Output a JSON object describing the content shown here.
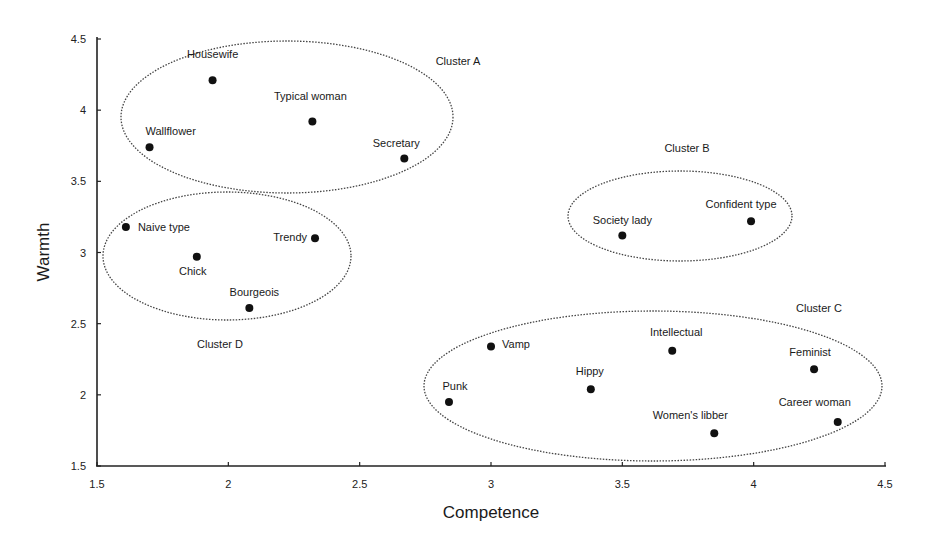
{
  "chart_data": {
    "type": "scatter",
    "title": "",
    "xlabel": "Competence",
    "ylabel": "Warmth",
    "xlim": [
      1.5,
      4.5
    ],
    "ylim": [
      1.5,
      4.5
    ],
    "x_ticks": [
      "1.5",
      "2",
      "2.5",
      "3",
      "3.5",
      "4",
      "4.5"
    ],
    "y_ticks": [
      "1.5",
      "2",
      "2.5",
      "3",
      "3.5",
      "4",
      "4.5"
    ],
    "grid": false,
    "legend": null,
    "points": [
      {
        "label": "Housewife",
        "x": 1.94,
        "y": 4.21,
        "cluster": "A"
      },
      {
        "label": "Typical woman",
        "x": 2.32,
        "y": 3.92,
        "cluster": "A"
      },
      {
        "label": "Wallflower",
        "x": 1.7,
        "y": 3.74,
        "cluster": "A"
      },
      {
        "label": "Secretary",
        "x": 2.67,
        "y": 3.66,
        "cluster": "A"
      },
      {
        "label": "Naive type",
        "x": 1.61,
        "y": 3.18,
        "cluster": "D"
      },
      {
        "label": "Trendy",
        "x": 2.33,
        "y": 3.1,
        "cluster": "D"
      },
      {
        "label": "Chick",
        "x": 1.88,
        "y": 2.97,
        "cluster": "D"
      },
      {
        "label": "Bourgeois",
        "x": 2.08,
        "y": 2.61,
        "cluster": "D"
      },
      {
        "label": "Society lady",
        "x": 3.5,
        "y": 3.12,
        "cluster": "B"
      },
      {
        "label": "Confident type",
        "x": 3.99,
        "y": 3.22,
        "cluster": "B"
      },
      {
        "label": "Vamp",
        "x": 3.0,
        "y": 2.34,
        "cluster": "C"
      },
      {
        "label": "Intellectual",
        "x": 3.69,
        "y": 2.31,
        "cluster": "C"
      },
      {
        "label": "Feminist",
        "x": 4.23,
        "y": 2.18,
        "cluster": "C"
      },
      {
        "label": "Hippy",
        "x": 3.38,
        "y": 2.04,
        "cluster": "C"
      },
      {
        "label": "Punk",
        "x": 2.84,
        "y": 1.95,
        "cluster": "C"
      },
      {
        "label": "Women's libber",
        "x": 3.85,
        "y": 1.73,
        "cluster": "C"
      },
      {
        "label": "Career woman",
        "x": 4.32,
        "y": 1.81,
        "cluster": "C"
      }
    ],
    "clusters": [
      {
        "name": "Cluster A",
        "members": [
          "Housewife",
          "Typical woman",
          "Wallflower",
          "Secretary"
        ]
      },
      {
        "name": "Cluster B",
        "members": [
          "Society lady",
          "Confident type"
        ]
      },
      {
        "name": "Cluster C",
        "members": [
          "Vamp",
          "Intellectual",
          "Feminist",
          "Hippy",
          "Punk",
          "Women's libber",
          "Career woman"
        ]
      },
      {
        "name": "Cluster D",
        "members": [
          "Naive type",
          "Trendy",
          "Chick",
          "Bourgeois"
        ]
      }
    ],
    "annotations": [
      "Cluster A",
      "Cluster B",
      "Cluster C",
      "Cluster D"
    ]
  },
  "layout": {
    "plot": {
      "x0": 97,
      "x1": 885,
      "y0": 466,
      "y1": 39
    },
    "point_label_offsets": {
      "Housewife": [
        0,
        -22,
        "middle"
      ],
      "Typical woman": [
        -2,
        -22,
        "middle"
      ],
      "Wallflower": [
        -4,
        -12,
        "start"
      ],
      "Secretary": [
        -8,
        -12,
        "middle"
      ],
      "Naive type": [
        12,
        4,
        "start"
      ],
      "Trendy": [
        -8,
        3,
        "end"
      ],
      "Chick": [
        -4,
        18,
        "middle"
      ],
      "Bourgeois": [
        5,
        -12,
        "middle"
      ],
      "Society lady": [
        0,
        -11,
        "middle"
      ],
      "Confident type": [
        -10,
        -13,
        "middle"
      ],
      "Vamp": [
        11,
        2,
        "start"
      ],
      "Intellectual": [
        4,
        -15,
        "middle"
      ],
      "Feminist": [
        -4,
        -13,
        "middle"
      ],
      "Hippy": [
        -1,
        -14,
        "middle"
      ],
      "Punk": [
        6,
        -12,
        "middle"
      ],
      "Women's libber": [
        -24,
        -14,
        "middle"
      ],
      "Career woman": [
        -23,
        -16,
        "middle"
      ]
    },
    "cluster_ellipses": {
      "Cluster A": {
        "cx": 287,
        "cy": 117,
        "rx": 166,
        "ry": 76,
        "lx": 458,
        "ly": 65
      },
      "Cluster B": {
        "cx": 680,
        "cy": 216,
        "rx": 112,
        "ry": 45,
        "lx": 687,
        "ly": 152
      },
      "Cluster C": {
        "cx": 653,
        "cy": 386,
        "rx": 229,
        "ry": 75,
        "lx": 819,
        "ly": 312
      },
      "Cluster D": {
        "cx": 227,
        "cy": 256,
        "rx": 124,
        "ry": 64,
        "lx": 220,
        "ly": 348
      }
    }
  }
}
